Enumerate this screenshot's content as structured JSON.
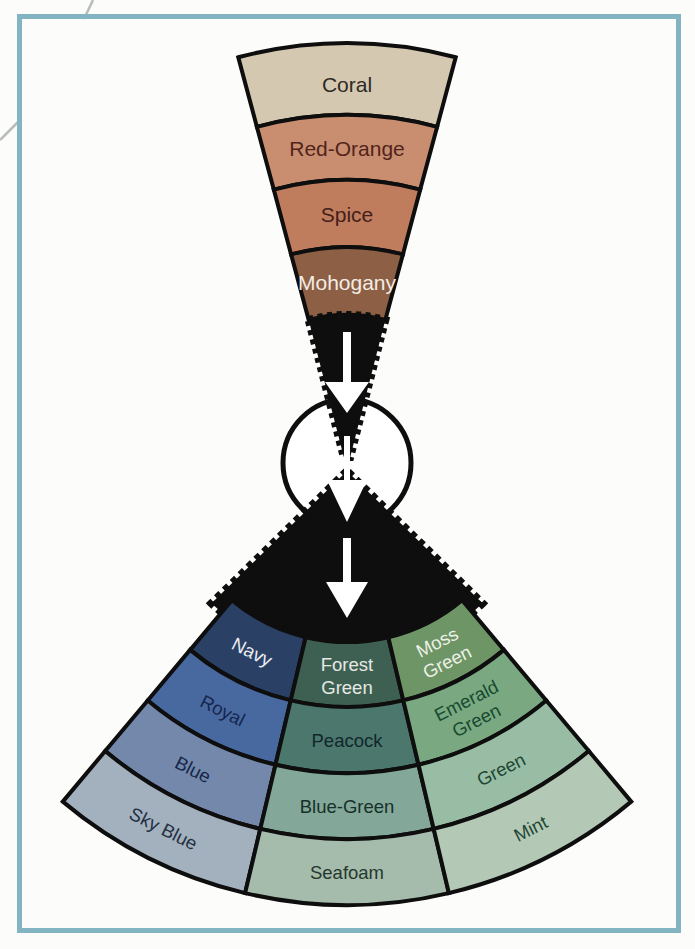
{
  "figure": {
    "background": "#fcfcfa",
    "frame_color": "#82b4c1",
    "outline_color": "#0e0e0e",
    "arrow_color": "#ffffff",
    "hub_fill": "#ffffff",
    "corner_line_color": "#b7bdb9"
  },
  "warm_wedge": {
    "segments": [
      {
        "label": "Coral",
        "color": "#d5c8b1",
        "text_color": "#2e2a24"
      },
      {
        "label": "Red-Orange",
        "color": "#c98e70",
        "text_color": "#52241c"
      },
      {
        "label": "Spice",
        "color": "#c07d5e",
        "text_color": "#44201a"
      },
      {
        "label": "Mohogany",
        "color": "#8d5f45",
        "text_color": "#f2ede4"
      }
    ]
  },
  "cool_fan": {
    "columns": [
      {
        "name": "blues",
        "segments": [
          {
            "label": "Navy",
            "lines": [
              "Navy"
            ],
            "color": "#2a4064",
            "text_color": "#e9edf3"
          },
          {
            "label": "Royal",
            "lines": [
              "Royal"
            ],
            "color": "#48699f",
            "text_color": "#15264d"
          },
          {
            "label": "Blue",
            "lines": [
              "Blue"
            ],
            "color": "#7388aa",
            "text_color": "#16264a"
          },
          {
            "label": "Sky Blue",
            "lines": [
              "Sky Blue"
            ],
            "color": "#a3b1bf",
            "text_color": "#232f42"
          }
        ]
      },
      {
        "name": "teals",
        "segments": [
          {
            "label": "Forest Green",
            "lines": [
              "Forest",
              "Green"
            ],
            "color": "#3e6053",
            "text_color": "#e6e9e2"
          },
          {
            "label": "Peacock",
            "lines": [
              "Peacock"
            ],
            "color": "#4b776d",
            "text_color": "#12282c"
          },
          {
            "label": "Blue-Green",
            "lines": [
              "Blue-Green"
            ],
            "color": "#83a899",
            "text_color": "#173029"
          },
          {
            "label": "Seafoam",
            "lines": [
              "Seafoam"
            ],
            "color": "#a5bbab",
            "text_color": "#25382e"
          }
        ]
      },
      {
        "name": "greens",
        "segments": [
          {
            "label": "Moss Green",
            "lines": [
              "Moss",
              "Green"
            ],
            "color": "#6d9566",
            "text_color": "#eef0e6"
          },
          {
            "label": "Emerald Green",
            "lines": [
              "Emerald",
              "Green"
            ],
            "color": "#7aa981",
            "text_color": "#174a30"
          },
          {
            "label": "Green",
            "lines": [
              "Green"
            ],
            "color": "#98bda4",
            "text_color": "#1d4733"
          },
          {
            "label": "Mint",
            "lines": [
              "Mint"
            ],
            "color": "#b4c9b5",
            "text_color": "#234636"
          }
        ]
      }
    ]
  }
}
